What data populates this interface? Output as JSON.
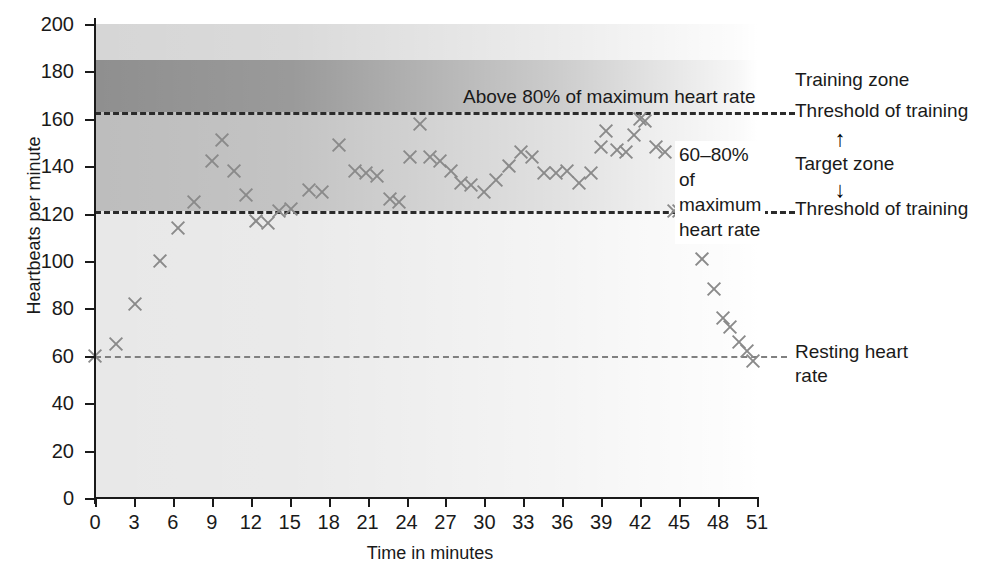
{
  "chart_data": {
    "type": "scatter",
    "title": "",
    "xlabel": "Time in minutes",
    "ylabel": "Heartbeats per minute",
    "xlim": [
      0,
      51
    ],
    "ylim": [
      0,
      200
    ],
    "xticks": [
      0,
      3,
      6,
      9,
      12,
      15,
      18,
      21,
      24,
      27,
      30,
      33,
      36,
      39,
      42,
      45,
      48,
      51
    ],
    "yticks": [
      0,
      20,
      40,
      60,
      80,
      100,
      120,
      140,
      160,
      180,
      200
    ],
    "grid": false,
    "legend_position": "right",
    "marker": "x",
    "marker_color": "#8a8a8a",
    "series": [
      {
        "name": "60-80% of maximum heart rate",
        "points": [
          [
            0.0,
            60
          ],
          [
            1.6,
            65
          ],
          [
            3.1,
            82
          ],
          [
            5.0,
            100
          ],
          [
            6.4,
            114
          ],
          [
            7.6,
            125
          ],
          [
            9.0,
            142
          ],
          [
            9.8,
            151
          ],
          [
            10.7,
            138
          ],
          [
            11.6,
            128
          ],
          [
            12.4,
            117
          ],
          [
            13.3,
            116
          ],
          [
            14.2,
            121
          ],
          [
            15.1,
            122
          ],
          [
            16.5,
            130
          ],
          [
            17.5,
            129
          ],
          [
            18.8,
            149
          ],
          [
            20.0,
            138
          ],
          [
            20.9,
            137
          ],
          [
            21.7,
            136
          ],
          [
            22.7,
            126
          ],
          [
            23.4,
            125
          ],
          [
            24.3,
            144
          ],
          [
            25.0,
            158
          ],
          [
            25.8,
            144
          ],
          [
            26.6,
            142
          ],
          [
            27.4,
            138
          ],
          [
            28.2,
            133
          ],
          [
            29.0,
            132
          ],
          [
            30.0,
            129
          ],
          [
            30.9,
            134
          ],
          [
            31.9,
            140
          ],
          [
            32.8,
            146
          ],
          [
            33.7,
            144
          ],
          [
            34.6,
            137
          ],
          [
            35.5,
            137
          ],
          [
            36.4,
            138
          ],
          [
            37.3,
            133
          ],
          [
            38.2,
            137
          ],
          [
            39.0,
            148
          ],
          [
            39.4,
            155
          ],
          [
            40.2,
            147
          ],
          [
            40.9,
            146
          ],
          [
            41.5,
            153
          ],
          [
            42.0,
            160
          ],
          [
            42.4,
            159
          ],
          [
            43.2,
            148
          ],
          [
            43.9,
            146
          ],
          [
            44.6,
            121
          ],
          [
            45.0,
            121
          ],
          [
            45.7,
            115
          ],
          [
            46.8,
            101
          ],
          [
            47.7,
            88
          ],
          [
            48.4,
            76
          ],
          [
            48.9,
            72
          ],
          [
            49.6,
            66
          ],
          [
            50.2,
            62
          ],
          [
            50.7,
            58
          ]
        ]
      }
    ],
    "reference_lines": [
      {
        "value": 163,
        "label": "Threshold of training",
        "style": "dashed-dark"
      },
      {
        "value": 121,
        "label": "Threshold of training",
        "style": "dashed-dark"
      },
      {
        "value": 60,
        "label": "Resting heart rate",
        "style": "dashed-light"
      }
    ],
    "bands": [
      {
        "from": 185,
        "to": 200,
        "name": "upper-band",
        "color": "#d6d6d6"
      },
      {
        "from": 163,
        "to": 185,
        "name": "above-80-band",
        "color": "#8f8f8f"
      },
      {
        "from": 121,
        "to": 163,
        "name": "target-zone-band",
        "color": "#bdbdbd"
      },
      {
        "from": 0,
        "to": 121,
        "name": "below-target-band",
        "color": "#e8e8e8"
      }
    ],
    "annotations": [
      {
        "name": "above-80-label",
        "text": "Above 80% of maximum heart rate"
      },
      {
        "name": "target-zone-label",
        "text": "60–80% of\nmaximum\nheart rate"
      }
    ]
  },
  "axes": {
    "y_title": "Heartbeats per minute",
    "x_title": "Time in minutes",
    "y_tick_labels": [
      "200",
      "180",
      "160",
      "140",
      "120",
      "100",
      "80",
      "60",
      "40",
      "20",
      "0"
    ],
    "x_tick_labels": [
      "0",
      "3",
      "6",
      "9",
      "12",
      "15",
      "18",
      "21",
      "24",
      "27",
      "30",
      "33",
      "36",
      "39",
      "42",
      "45",
      "48",
      "51"
    ]
  },
  "annotations": {
    "above_80": "Above 80% of maximum heart rate",
    "target_line1": "60–80% of",
    "target_line2": "maximum",
    "target_line3": "heart rate"
  },
  "legend": {
    "training_zone": "Training zone",
    "threshold_upper": "Threshold of training",
    "target_zone": "Target zone",
    "threshold_lower": "Threshold of training",
    "resting_line1": "Resting heart",
    "resting_line2": "rate",
    "arrow_up": "↑",
    "arrow_down": "↓"
  },
  "colors": {
    "marker": "#8a8a8a",
    "text": "#1a1a1a",
    "dash_dark": "#2b2b2b",
    "dash_light": "#808080"
  }
}
